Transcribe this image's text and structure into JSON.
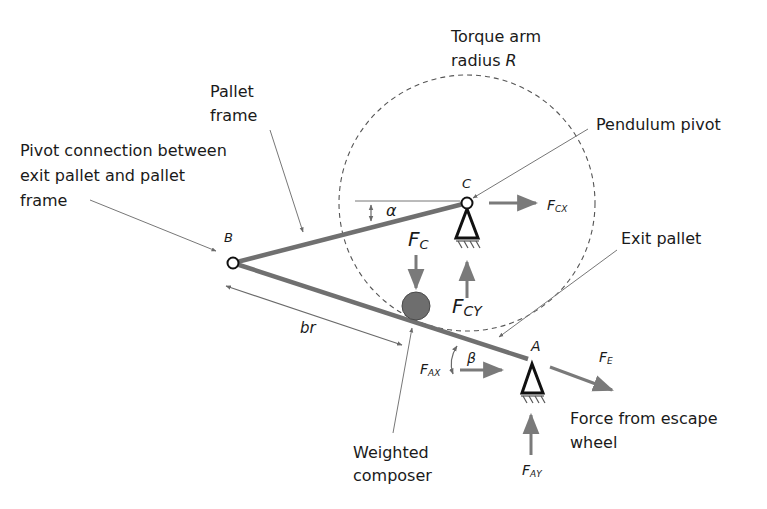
{
  "diagram": {
    "type": "free-body mechanism diagram",
    "colors": {
      "member": "#707070",
      "arrow": "#7a7a7a",
      "support": "#1a1a1a",
      "ball": "#6e6e6e",
      "circle_dashed": "#555555",
      "text": "#1a1a1a"
    },
    "labels": {
      "torque_arm_line1": "Torque arm",
      "torque_arm_line2": "radius ",
      "torque_arm_symbol": "R",
      "pallet_frame_line1": "Pallet",
      "pallet_frame_line2": "frame",
      "pivot_conn_line1": "Pivot connection between",
      "pivot_conn_line2": "exit pallet and pallet",
      "pivot_conn_line3": "frame",
      "pendulum_pivot": "Pendulum pivot",
      "exit_pallet": "Exit pallet",
      "weighted_composer_line1": "Weighted",
      "weighted_composer_line2": "composer",
      "force_escape_line1": "Force from escape",
      "force_escape_line2": "wheel"
    },
    "points": {
      "B": "B",
      "C": "C",
      "A": "A"
    },
    "symbols": {
      "alpha": "α",
      "beta": "β",
      "br": "br",
      "Fc_main": "F",
      "Fc_sub": "C",
      "Fcx_main": "F",
      "Fcx_sub": "CX",
      "Fcy_main": "F",
      "Fcy_sub": "CY",
      "Fax_main": "F",
      "Fax_sub": "AX",
      "Fay_main": "F",
      "Fay_sub": "AY",
      "Fe_main": "F",
      "Fe_sub": "E"
    }
  }
}
